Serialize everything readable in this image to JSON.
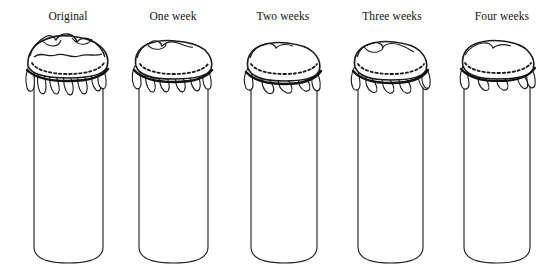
{
  "figure": {
    "type": "line-drawing-series",
    "background_color": "#ffffff",
    "stroke_color": "#111111",
    "width": 560,
    "height": 278,
    "panel_count": 5
  },
  "panels": [
    {
      "label": "Original",
      "label_x": 68,
      "label_y": 10,
      "jar": {
        "left": 34,
        "right": 103,
        "top": 72,
        "bottom": 263,
        "center_x": 68.5,
        "width": 69
      },
      "cap": {
        "center_x": 68,
        "top": 36,
        "dash_line_y": 65,
        "band_y": 72,
        "skirt_bottom": 95,
        "half_width": 40,
        "ruffle_intensity": "high",
        "has_wavy_crease": true,
        "skirt_points": 7
      }
    },
    {
      "label": "One week",
      "label_x": 173,
      "label_y": 10,
      "jar": {
        "left": 139,
        "right": 208,
        "top": 72,
        "bottom": 263,
        "center_x": 173.5,
        "width": 69
      },
      "cap": {
        "center_x": 173,
        "top": 40,
        "dash_line_y": 66,
        "band_y": 73,
        "skirt_bottom": 92,
        "half_width": 39,
        "ruffle_intensity": "medium-high",
        "has_wavy_crease": false,
        "skirt_points": 6
      }
    },
    {
      "label": "Two weeks",
      "label_x": 283,
      "label_y": 10,
      "jar": {
        "left": 251,
        "right": 317,
        "top": 72,
        "bottom": 263,
        "center_x": 284,
        "width": 66
      },
      "cap": {
        "center_x": 284,
        "top": 42,
        "dash_line_y": 66,
        "band_y": 76,
        "skirt_bottom": 93,
        "half_width": 37,
        "ruffle_intensity": "medium",
        "has_wavy_crease": false,
        "skirt_points": 4
      }
    },
    {
      "label": "Three weeks",
      "label_x": 392,
      "label_y": 10,
      "jar": {
        "left": 358,
        "right": 423,
        "top": 72,
        "bottom": 263,
        "center_x": 390.5,
        "width": 65
      },
      "cap": {
        "center_x": 391,
        "top": 42,
        "dash_line_y": 66,
        "band_y": 76,
        "skirt_bottom": 93,
        "half_width": 37,
        "ruffle_intensity": "medium",
        "has_wavy_crease": false,
        "skirt_points": 5
      }
    },
    {
      "label": "Four weeks",
      "label_x": 502,
      "label_y": 10,
      "jar": {
        "left": 464,
        "right": 530,
        "top": 72,
        "bottom": 263,
        "center_x": 497,
        "width": 66
      },
      "cap": {
        "center_x": 499,
        "top": 42,
        "dash_line_y": 66,
        "band_y": 74,
        "skirt_bottom": 90,
        "half_width": 36,
        "ruffle_intensity": "low",
        "has_wavy_crease": false,
        "skirt_points": 4
      }
    }
  ]
}
